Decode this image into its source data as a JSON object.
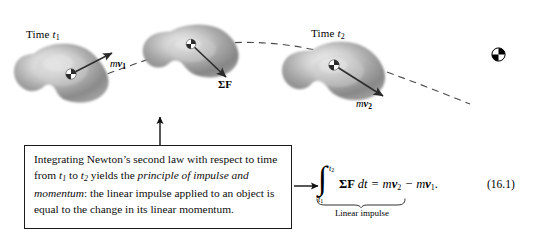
{
  "figure": {
    "kind": "physics-textbook-figure",
    "equation_number": "(16.1)",
    "background_color": "#ffffff",
    "ink_color": "#000000"
  },
  "stages": [
    {
      "id": "stage-1",
      "time_label_prefix": "Time ",
      "time_label_symbol": "t",
      "time_label_subscript": "1",
      "vector_label": {
        "scalar": "m",
        "vector": "v",
        "subscript": "1"
      }
    },
    {
      "id": "stage-2",
      "force_label": "ΣF"
    },
    {
      "id": "stage-3",
      "time_label_prefix": "Time ",
      "time_label_symbol": "t",
      "time_label_subscript": "2",
      "vector_label": {
        "scalar": "m",
        "vector": "v",
        "subscript": "2"
      }
    }
  ],
  "callout": {
    "line_1_a": "Integrating Newton’s second law with respect",
    "line_2_a": "to time from ",
    "line_2_t1": "t",
    "line_2_sub1": "1",
    "line_2_b": " to ",
    "line_2_t2": "t",
    "line_2_sub2": "2",
    "line_2_c": " yields the ",
    "line_2_italic": "principle of",
    "line_3_italic": "impulse and momentum",
    "line_3_b": ": the linear impulse",
    "line_4": "applied to an object is equal to the change in its",
    "line_5": "linear momentum."
  },
  "equation": {
    "integral_glyph": "∫",
    "upper_limit_symbol": "t",
    "upper_limit_subscript": "2",
    "lower_limit_symbol": "t",
    "lower_limit_subscript": "1",
    "integrand_sigma_f": "ΣF",
    "differential": "dt",
    "equals": "=",
    "rhs_m1": "m",
    "rhs_v1": "v",
    "rhs_sub1": "2",
    "minus": "−",
    "rhs_m2": "m",
    "rhs_v2": "v",
    "rhs_sub2": "1",
    "period": ".",
    "brace_label": "Linear impulse",
    "number": "(16.1)"
  },
  "icons": {
    "center_of_mass": "center-of-mass-icon",
    "up_arrow": "up-arrow-icon",
    "right_arrow": "right-arrow-icon",
    "trajectory": "dashed-trajectory-icon"
  }
}
